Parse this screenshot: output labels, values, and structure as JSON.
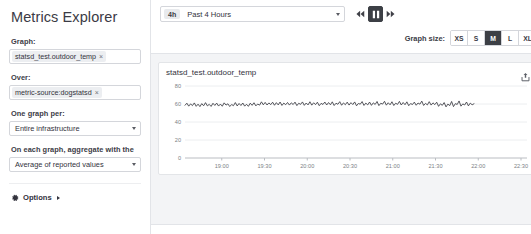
{
  "sidebar": {
    "title": "Metrics Explorer",
    "fields": [
      {
        "label": "Graph:",
        "type": "tag-input",
        "tag": "statsd_test.outdoor_temp",
        "remove": "×"
      },
      {
        "label": "Over:",
        "type": "tag-input",
        "tag": "metric-source:dogstatsd",
        "remove": "×"
      },
      {
        "label": "One graph per:",
        "type": "select",
        "value": "Entire infrastructure"
      },
      {
        "label": "On each graph, aggregate with the",
        "type": "select",
        "value": "Average of reported values"
      }
    ],
    "options_label": "Options"
  },
  "toolbar": {
    "time_range_badge": "4h",
    "time_range_text": "Past 4 Hours",
    "playback": {
      "rewind_label": "Rewind",
      "pause_label": "Pause",
      "forward_label": "Fast forward"
    },
    "graph_size_label": "Graph size:",
    "graph_sizes": [
      "XS",
      "S",
      "M",
      "L",
      "XL"
    ],
    "graph_size_selected": "M"
  },
  "chart_card": {
    "title": "statsd_test.outdoor_temp",
    "export_icon": "export-icon"
  },
  "colors": {
    "line": "#3b3b42",
    "grid": "#eceef0",
    "axis_text": "#7c7f86",
    "accent_dark": "#3c3f45",
    "page_bg": "#f3f4f6"
  },
  "chart_data": {
    "type": "line",
    "title": "statsd_test.outdoor_temp",
    "xlabel": "",
    "ylabel": "",
    "ylim": [
      0,
      80
    ],
    "yticks": [
      0,
      20,
      40,
      60,
      80
    ],
    "xticks": [
      "19:00",
      "19:30",
      "20:00",
      "20:30",
      "21:00",
      "21:30",
      "22:00",
      "22:30"
    ],
    "grid": true,
    "legend": false,
    "series": [
      {
        "name": "statsd_test.outdoor_temp",
        "color": "#3b3b42",
        "x_start": "18:40",
        "x_end": "22:05",
        "values": [
          58.6,
          60.9,
          57.6,
          60.1,
          58.2,
          61.2,
          57.4,
          59.8,
          57.1,
          60.4,
          58.0,
          61.5,
          57.9,
          59.6,
          57.3,
          60.8,
          58.4,
          61.0,
          57.7,
          59.9,
          57.5,
          61.3,
          58.8,
          60.2,
          57.2,
          59.4,
          58.1,
          61.6,
          57.8,
          60.6,
          58.3,
          61.1,
          57.6,
          59.7,
          57.4,
          60.9,
          58.5,
          61.4,
          57.9,
          60.0,
          58.7,
          62.4,
          59.1,
          61.8,
          58.9,
          61.2,
          59.3,
          62.0,
          58.6,
          61.5,
          59.0,
          62.2,
          58.4,
          61.0,
          59.2,
          61.7,
          58.8,
          61.3,
          59.4,
          62.1,
          58.2,
          60.8,
          59.6,
          62.3,
          58.5,
          61.1,
          59.0,
          62.5,
          58.7,
          61.4,
          59.3,
          62.0,
          58.1,
          60.7,
          59.5,
          62.2,
          58.9,
          61.6,
          59.1,
          62.4,
          58.3,
          60.9,
          59.7,
          62.6,
          58.6,
          61.2,
          59.2,
          62.1,
          58.8,
          61.5,
          59.4,
          62.3,
          58.0,
          60.6,
          59.8,
          62.7,
          58.4,
          61.0,
          59.0,
          62.2,
          58.5,
          61.3,
          59.5,
          62.8,
          58.2,
          60.8,
          59.9,
          63.0,
          58.7,
          61.4,
          59.1,
          62.5,
          58.3,
          60.9,
          59.6,
          62.9,
          58.9,
          61.7,
          59.2,
          62.4,
          58.1,
          60.5,
          59.4,
          62.1,
          58.6,
          61.1,
          59.8,
          63.2,
          58.4,
          60.7,
          59.0,
          62.6,
          58.8,
          61.3,
          59.3,
          62.0,
          57.4,
          60.2,
          58.5,
          61.6,
          56.8,
          59.9,
          58.2,
          62.8,
          57.1,
          60.4,
          59.5,
          63.4,
          57.6,
          60.1,
          58.9,
          62.2,
          57.9,
          61.0,
          59.1,
          60.3
        ]
      }
    ]
  }
}
